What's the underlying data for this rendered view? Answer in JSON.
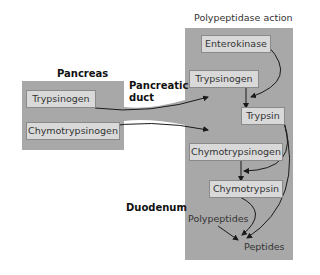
{
  "title": "Polypeptidase action",
  "regions": {
    "pancreas": "Pancreas",
    "duct": [
      "Pancreatic",
      "duct"
    ],
    "duodenum": "Duodenum"
  },
  "pancreas_boxes": [
    "Trypsinogen",
    "Chymotrypsinogen"
  ],
  "duodenum_boxes": {
    "enterokinase": "Enterokinase",
    "trypsinogen": "Trypsinogen",
    "trypsin": "Trypsin",
    "chymotrypsinogen": "Chymotrypsinogen",
    "chymotrypsin": "Chymotrypsin"
  },
  "labels": {
    "polypeptides": "Polypeptides",
    "peptides": "Peptides"
  },
  "colors": {
    "region_fill": "#a8a8a8",
    "box_fill": "#d9d9d9",
    "arrow": "#1a1a1a"
  }
}
